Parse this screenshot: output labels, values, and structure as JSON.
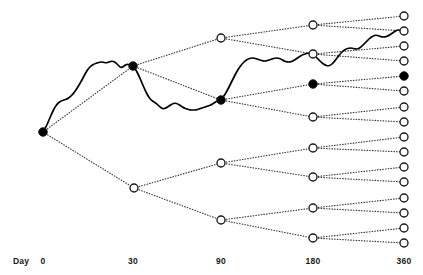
{
  "figure": {
    "title": "",
    "axis_caption": "Day",
    "colors": {
      "node_fill_open": "#ffffff",
      "node_fill_closed": "#000000",
      "node_stroke": "#1a1a1a",
      "branch_line": "#3a3a3a",
      "path_line": "#000000",
      "text": "#1a1a1a",
      "background": "#ffffff"
    }
  },
  "chart_data": {
    "type": "scatter",
    "title": "",
    "xlabel": "Day",
    "ylabel": "",
    "grid": false,
    "legend": null,
    "xlim": [
      0,
      360
    ],
    "x_tick_labels": [
      "0",
      "30",
      "90",
      "180",
      "360"
    ],
    "x_tick_values": [
      0,
      30,
      90,
      180,
      360
    ],
    "x_tick_pixels": [
      43,
      133,
      221,
      313,
      404
    ],
    "stages": [
      {
        "day": 0,
        "node_count": 1
      },
      {
        "day": 30,
        "node_count": 2
      },
      {
        "day": 90,
        "node_count": 4
      },
      {
        "day": 180,
        "node_count": 8
      },
      {
        "day": 360,
        "node_count": 16
      }
    ],
    "nodes": [
      {
        "id": "n0",
        "day": 0,
        "x": 43,
        "y": 132,
        "state": "filled"
      },
      {
        "id": "n30-1",
        "day": 30,
        "x": 133,
        "y": 66,
        "state": "filled"
      },
      {
        "id": "n30-2",
        "day": 30,
        "x": 134,
        "y": 188,
        "state": "open"
      },
      {
        "id": "n90-1",
        "day": 90,
        "x": 221,
        "y": 38,
        "state": "open"
      },
      {
        "id": "n90-2",
        "day": 90,
        "x": 221,
        "y": 100,
        "state": "filled"
      },
      {
        "id": "n90-3",
        "day": 90,
        "x": 221,
        "y": 163,
        "state": "open"
      },
      {
        "id": "n90-4",
        "day": 90,
        "x": 221,
        "y": 220,
        "state": "open"
      },
      {
        "id": "n180-1",
        "day": 180,
        "x": 313,
        "y": 25,
        "state": "open"
      },
      {
        "id": "n180-2",
        "day": 180,
        "x": 313,
        "y": 54,
        "state": "open"
      },
      {
        "id": "n180-3",
        "day": 180,
        "x": 313,
        "y": 84,
        "state": "filled"
      },
      {
        "id": "n180-4",
        "day": 180,
        "x": 313,
        "y": 117,
        "state": "open"
      },
      {
        "id": "n180-5",
        "day": 180,
        "x": 313,
        "y": 148,
        "state": "open"
      },
      {
        "id": "n180-6",
        "day": 180,
        "x": 313,
        "y": 177,
        "state": "open"
      },
      {
        "id": "n180-7",
        "day": 180,
        "x": 313,
        "y": 208,
        "state": "open"
      },
      {
        "id": "n180-8",
        "day": 180,
        "x": 313,
        "y": 238,
        "state": "open"
      },
      {
        "id": "n360-1",
        "day": 360,
        "x": 404,
        "y": 16,
        "state": "open"
      },
      {
        "id": "n360-2",
        "day": 360,
        "x": 404,
        "y": 31,
        "state": "open"
      },
      {
        "id": "n360-3",
        "day": 360,
        "x": 404,
        "y": 46,
        "state": "open"
      },
      {
        "id": "n360-4",
        "day": 360,
        "x": 404,
        "y": 61,
        "state": "open"
      },
      {
        "id": "n360-5",
        "day": 360,
        "x": 404,
        "y": 76,
        "state": "filled"
      },
      {
        "id": "n360-6",
        "day": 360,
        "x": 404,
        "y": 91,
        "state": "open"
      },
      {
        "id": "n360-7",
        "day": 360,
        "x": 404,
        "y": 107,
        "state": "open"
      },
      {
        "id": "n360-8",
        "day": 360,
        "x": 404,
        "y": 122,
        "state": "open"
      },
      {
        "id": "n360-9",
        "day": 360,
        "x": 404,
        "y": 137,
        "state": "open"
      },
      {
        "id": "n360-10",
        "day": 360,
        "x": 404,
        "y": 152,
        "state": "open"
      },
      {
        "id": "n360-11",
        "day": 360,
        "x": 404,
        "y": 167,
        "state": "open"
      },
      {
        "id": "n360-12",
        "day": 360,
        "x": 404,
        "y": 182,
        "state": "open"
      },
      {
        "id": "n360-13",
        "day": 360,
        "x": 404,
        "y": 198,
        "state": "open"
      },
      {
        "id": "n360-14",
        "day": 360,
        "x": 404,
        "y": 213,
        "state": "open"
      },
      {
        "id": "n360-15",
        "day": 360,
        "x": 404,
        "y": 228,
        "state": "open"
      },
      {
        "id": "n360-16",
        "day": 360,
        "x": 404,
        "y": 243,
        "state": "open"
      }
    ],
    "edges": [
      [
        "n0",
        "n30-1"
      ],
      [
        "n0",
        "n30-2"
      ],
      [
        "n30-1",
        "n90-1"
      ],
      [
        "n30-1",
        "n90-2"
      ],
      [
        "n30-2",
        "n90-3"
      ],
      [
        "n30-2",
        "n90-4"
      ],
      [
        "n90-1",
        "n180-1"
      ],
      [
        "n90-1",
        "n180-2"
      ],
      [
        "n90-2",
        "n180-3"
      ],
      [
        "n90-2",
        "n180-4"
      ],
      [
        "n90-3",
        "n180-5"
      ],
      [
        "n90-3",
        "n180-6"
      ],
      [
        "n90-4",
        "n180-7"
      ],
      [
        "n90-4",
        "n180-8"
      ],
      [
        "n180-1",
        "n360-1"
      ],
      [
        "n180-1",
        "n360-2"
      ],
      [
        "n180-2",
        "n360-3"
      ],
      [
        "n180-2",
        "n360-4"
      ],
      [
        "n180-3",
        "n360-5"
      ],
      [
        "n180-3",
        "n360-6"
      ],
      [
        "n180-4",
        "n360-7"
      ],
      [
        "n180-4",
        "n360-8"
      ],
      [
        "n180-5",
        "n360-9"
      ],
      [
        "n180-5",
        "n360-10"
      ],
      [
        "n180-6",
        "n360-11"
      ],
      [
        "n180-6",
        "n360-12"
      ],
      [
        "n180-7",
        "n360-13"
      ],
      [
        "n180-7",
        "n360-14"
      ],
      [
        "n180-8",
        "n360-15"
      ],
      [
        "n180-8",
        "n360-16"
      ]
    ],
    "realized_path_nodes": [
      "n0",
      "n30-1",
      "n90-2",
      "n180-3",
      "n360-5"
    ],
    "realized_path_points": [
      [
        43,
        132
      ],
      [
        46,
        127
      ],
      [
        49,
        120
      ],
      [
        52,
        113
      ],
      [
        55,
        107
      ],
      [
        58,
        103
      ],
      [
        61,
        101
      ],
      [
        64,
        100
      ],
      [
        67,
        99
      ],
      [
        70,
        97
      ],
      [
        73,
        94
      ],
      [
        76,
        90
      ],
      [
        79,
        85
      ],
      [
        82,
        80
      ],
      [
        85,
        74
      ],
      [
        88,
        69
      ],
      [
        91,
        66
      ],
      [
        94,
        64
      ],
      [
        97,
        63
      ],
      [
        100,
        62
      ],
      [
        103,
        62
      ],
      [
        106,
        63
      ],
      [
        109,
        62
      ],
      [
        112,
        61
      ],
      [
        115,
        62
      ],
      [
        118,
        65
      ],
      [
        121,
        68
      ],
      [
        124,
        66
      ],
      [
        127,
        64
      ],
      [
        130,
        65
      ],
      [
        133,
        66
      ],
      [
        136,
        70
      ],
      [
        139,
        76
      ],
      [
        142,
        83
      ],
      [
        145,
        90
      ],
      [
        148,
        96
      ],
      [
        151,
        100
      ],
      [
        154,
        102
      ],
      [
        157,
        104
      ],
      [
        160,
        107
      ],
      [
        163,
        109
      ],
      [
        166,
        108
      ],
      [
        169,
        106
      ],
      [
        172,
        104
      ],
      [
        175,
        103
      ],
      [
        178,
        104
      ],
      [
        181,
        106
      ],
      [
        184,
        108
      ],
      [
        187,
        109
      ],
      [
        190,
        110
      ],
      [
        193,
        110
      ],
      [
        196,
        110
      ],
      [
        199,
        109
      ],
      [
        202,
        108
      ],
      [
        205,
        107
      ],
      [
        208,
        106
      ],
      [
        211,
        105
      ],
      [
        214,
        103
      ],
      [
        217,
        101
      ],
      [
        221,
        100
      ],
      [
        224,
        96
      ],
      [
        227,
        91
      ],
      [
        230,
        85
      ],
      [
        233,
        79
      ],
      [
        236,
        73
      ],
      [
        239,
        68
      ],
      [
        242,
        64
      ],
      [
        245,
        61
      ],
      [
        248,
        59
      ],
      [
        251,
        58
      ],
      [
        254,
        58
      ],
      [
        257,
        59
      ],
      [
        260,
        60
      ],
      [
        263,
        61
      ],
      [
        266,
        61
      ],
      [
        269,
        60
      ],
      [
        272,
        59
      ],
      [
        275,
        58
      ],
      [
        278,
        58
      ],
      [
        281,
        59
      ],
      [
        284,
        61
      ],
      [
        287,
        62
      ],
      [
        290,
        62
      ],
      [
        293,
        61
      ],
      [
        296,
        59
      ],
      [
        299,
        57
      ],
      [
        302,
        55
      ],
      [
        305,
        54
      ],
      [
        308,
        53
      ],
      [
        311,
        53
      ],
      [
        313,
        54
      ],
      [
        316,
        57
      ],
      [
        319,
        60
      ],
      [
        322,
        63
      ],
      [
        325,
        65
      ],
      [
        328,
        66
      ],
      [
        331,
        65
      ],
      [
        334,
        62
      ],
      [
        337,
        58
      ],
      [
        340,
        54
      ],
      [
        343,
        51
      ],
      [
        346,
        49
      ],
      [
        349,
        48
      ],
      [
        352,
        48
      ],
      [
        355,
        49
      ],
      [
        358,
        49
      ],
      [
        361,
        47
      ],
      [
        364,
        44
      ],
      [
        367,
        41
      ],
      [
        370,
        38
      ],
      [
        373,
        36
      ],
      [
        376,
        35
      ],
      [
        379,
        36
      ],
      [
        382,
        37
      ],
      [
        385,
        37
      ],
      [
        388,
        36
      ],
      [
        391,
        34
      ],
      [
        394,
        32
      ],
      [
        397,
        30
      ],
      [
        400,
        30
      ],
      [
        404,
        31
      ]
    ]
  },
  "axis": {
    "caption": {
      "text": "Day",
      "x": 13,
      "y": 256
    },
    "ticks": [
      {
        "label": "0",
        "x": 43,
        "y": 256
      },
      {
        "label": "30",
        "x": 133,
        "y": 256
      },
      {
        "label": "90",
        "x": 221,
        "y": 256
      },
      {
        "label": "180",
        "x": 313,
        "y": 256
      },
      {
        "label": "360",
        "x": 404,
        "y": 256
      }
    ]
  }
}
